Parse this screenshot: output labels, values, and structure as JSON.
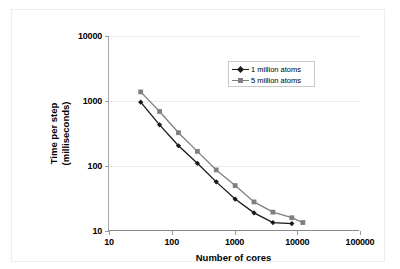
{
  "figure": {
    "background_color": "#ffffff",
    "frame_color": "#ededed"
  },
  "axis_titles": {
    "x": "Number of cores",
    "y_line1": "Time per step",
    "y_line2": "(milliseconds)"
  },
  "legend": {
    "position": "inside-top-right",
    "entries": [
      {
        "label": "1 million atoms",
        "color": "#1a1a1a",
        "marker": "diamond"
      },
      {
        "label": "5 million atoms",
        "color": "#808080",
        "marker": "square"
      }
    ]
  },
  "ticks": {
    "x": [
      "10",
      "100",
      "1000",
      "10000",
      "100000"
    ],
    "y": [
      "10",
      "100",
      "1000",
      "10000"
    ]
  },
  "chart_data": {
    "type": "line",
    "title": "",
    "xlabel": "Number of cores",
    "ylabel": "Time per step (milliseconds)",
    "xscale": "log",
    "yscale": "log",
    "xlim": [
      10,
      100000
    ],
    "ylim": [
      10,
      10000
    ],
    "grid": "horizontal",
    "legend_position": "inside-top-right",
    "series": [
      {
        "name": "1 million atoms",
        "color": "#1a1a1a",
        "marker": "diamond",
        "x": [
          32,
          64,
          128,
          256,
          512,
          1024,
          2048,
          4096,
          8192
        ],
        "y": [
          960,
          430,
          205,
          110,
          57,
          31,
          19,
          13.5,
          13
        ]
      },
      {
        "name": "5 million atoms",
        "color": "#808080",
        "marker": "square",
        "x": [
          32,
          64,
          128,
          256,
          512,
          1024,
          2048,
          4096,
          8192,
          12288
        ],
        "y": [
          1380,
          690,
          325,
          168,
          87,
          50,
          28,
          19.5,
          16,
          13.5
        ]
      }
    ]
  }
}
